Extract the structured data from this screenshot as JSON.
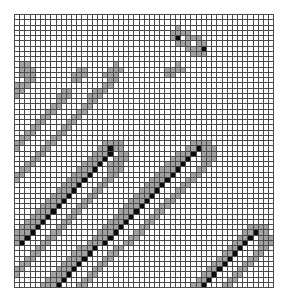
{
  "figure": {
    "type": "grid-raster",
    "title": "",
    "background_color": "#ffffff",
    "gridline_color": "#4a4a4a",
    "plot": {
      "left": 14,
      "top": 14,
      "width": 260,
      "height": 273
    }
  },
  "chart_data": {
    "type": "heatmap",
    "title": "",
    "subtitle": "",
    "xlabel": "",
    "ylabel": "",
    "legend": [],
    "annotations": [],
    "grid": true,
    "legend_position": "none",
    "columns": 50,
    "rows": 52,
    "xlim": [
      0,
      50
    ],
    "ylim": [
      0,
      52
    ],
    "xtick_labels": [],
    "ytick_labels": [],
    "value_levels": [
      0,
      1,
      2
    ],
    "value_labels": [
      "empty",
      "partial",
      "full"
    ],
    "level_colors": [
      "#ffffff",
      "#808080",
      "#0a0a0a"
    ],
    "cell_size_px": 5.2,
    "matrix": [
      "00000000000000000000000000000000000000000000000000",
      "00000000000000000000000000000000000000000000000000",
      "00000000000000000000000000000001000000000000000000",
      "00000000000000000000000000000011110000000000000000",
      "00000000000000000000000000000012011100000000000000",
      "00000000000000000000000000000001110110000000000000",
      "00000000000000000000000000000000011120000000000000",
      "00000000000000000000000000000000001110000000000000",
      "00000000000000000000000000000000000000000000000000",
      "01100000000000000001000000000001000000000000000000",
      "01110000000011000011100000000111100000000000000000",
      "01110000000111000111000000000110000000000000000000",
      "00110000000110000011000000000000000000000000000000",
      "11100000000000000110000000000000000000000000000000",
      "11000000011000011100000000000000000000000000000000",
      "10000000111000111000000000000000000000000000000000",
      "00000000110000110000000000000000000000000000000000",
      "00000001100001100000000000000000000000000000000000",
      "00000011000011000000000000000000000000000000000000",
      "00000110000110000000000000000000000000000000000000",
      "00001100001100000000000000000000000000000000000000",
      "00011000011000000000000000000000000000000000000000",
      "00110000110000000000000000000000000000000000000000",
      "01100001100000000000000000000000000000000000000000",
      "11000011000000000111100000000000001111000000000000",
      "10000110000000001121100000000000011211100000000000",
      "00001100000000011120110000000001112011100000000000",
      "00011000000000111201110000000011120011100000000000",
      "00110000000001112011100000000111200011000000000000",
      "01100000000011120011100000001112000110000000000000",
      "11000000000111200011000000011120001100000000000000",
      "10000000001112000110000000111200011000000000000000",
      "00000000011120001100000001112000110000000000000000",
      "00000000111200011000000011120001100000000000000000",
      "00000001112000110000000111200011000000000000000000",
      "00000011120001100000001112000110000000000000000000",
      "00000111200011000000011120001100000000000000000000",
      "00001112000110000000111200011000000000000000000000",
      "00011120001100000001112000110000000000000000000000",
      "00111200011000000011120001100000000000000000000000",
      "01112000110000000111200011000000000000000000011110",
      "11120001100000001112000110000000000000000000112110",
      "11200011000000011120001100000000000000000001120111",
      "12000110000000111200011000000000000000000011200111",
      "00001100000011120001100000000000000000000112000110",
      "00011000000111200011000000000000000000001120001100",
      "00110000001112000110000000000000000000011200011000",
      "01100000011120001100000000000000000000112000110000",
      "11000000111200011000000000000000000001120001100000",
      "10000001112000110000000000000000000011200011000000",
      "00000011120001100000000000000000000112000110000000",
      "00000111200011000000000000000000001120001100000000"
    ]
  }
}
